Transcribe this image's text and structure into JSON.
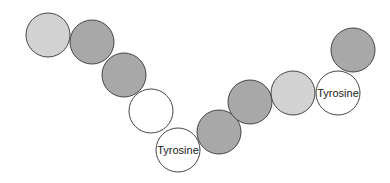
{
  "diagram": {
    "colors": {
      "light": "#d2d2d2",
      "dark": "#a8a8a8",
      "white": "#ffffff",
      "stroke": "#444444"
    },
    "residues": [
      {
        "id": 1,
        "cx": 48,
        "cy": 35,
        "r": 22,
        "shade": "light",
        "label": ""
      },
      {
        "id": 2,
        "cx": 92,
        "cy": 42,
        "r": 22,
        "shade": "dark",
        "label": ""
      },
      {
        "id": 3,
        "cx": 124,
        "cy": 75,
        "r": 22,
        "shade": "dark",
        "label": ""
      },
      {
        "id": 4,
        "cx": 151,
        "cy": 111,
        "r": 22,
        "shade": "white",
        "label": ""
      },
      {
        "id": 5,
        "cx": 178,
        "cy": 150,
        "r": 22,
        "shade": "white",
        "label": "Tyrosine"
      },
      {
        "id": 6,
        "cx": 219,
        "cy": 132,
        "r": 22,
        "shade": "dark",
        "label": ""
      },
      {
        "id": 7,
        "cx": 250,
        "cy": 102,
        "r": 22,
        "shade": "dark",
        "label": ""
      },
      {
        "id": 8,
        "cx": 293,
        "cy": 93,
        "r": 22,
        "shade": "light",
        "label": ""
      },
      {
        "id": 9,
        "cx": 338,
        "cy": 93,
        "r": 22,
        "shade": "white",
        "label": "Tyrosine"
      },
      {
        "id": 10,
        "cx": 353,
        "cy": 50,
        "r": 22,
        "shade": "dark",
        "label": ""
      }
    ]
  }
}
